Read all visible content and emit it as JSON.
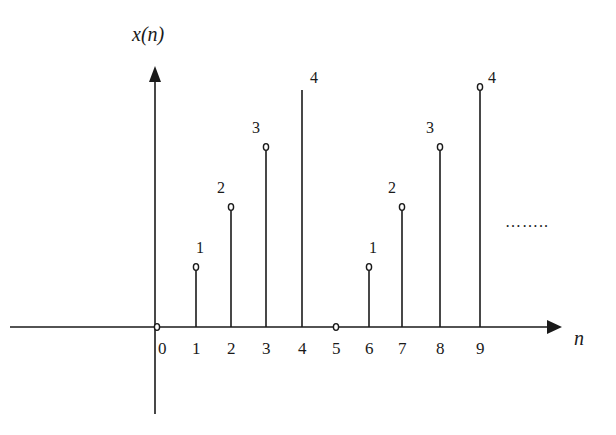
{
  "chart_data": {
    "type": "stem",
    "title": "",
    "xlabel": "n",
    "ylabel": "x(n)",
    "x": [
      0,
      1,
      2,
      3,
      4,
      5,
      6,
      7,
      8,
      9
    ],
    "values": [
      0,
      1,
      2,
      3,
      4,
      0,
      1,
      2,
      3,
      4
    ],
    "value_labels": [
      "",
      "1",
      "2",
      "3",
      "4",
      "",
      "1",
      "2",
      "3",
      "4"
    ],
    "tick_labels": [
      "0",
      "1",
      "2",
      "3",
      "4",
      "5",
      "6",
      "7",
      "8",
      "9"
    ],
    "continuation": "……..",
    "grid": false,
    "legend": "none"
  }
}
